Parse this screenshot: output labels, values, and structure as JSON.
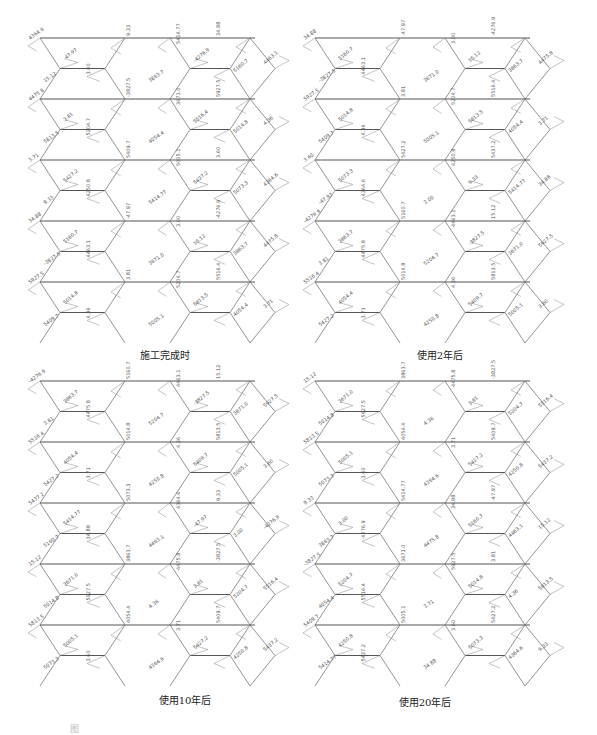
{
  "figure": {
    "type": "structural internal-force diagram (diagrid frame)",
    "panels": [
      {
        "id": "p1",
        "caption": "施工完成时",
        "x": 30,
        "y": 32,
        "w": 255,
        "h": 310,
        "cap_x": 165,
        "cap_y": 347
      },
      {
        "id": "p2",
        "caption": "使用2年后",
        "x": 305,
        "y": 32,
        "w": 255,
        "h": 310,
        "cap_x": 440,
        "cap_y": 347
      },
      {
        "id": "p3",
        "caption": "使用10年后",
        "x": 30,
        "y": 375,
        "w": 255,
        "h": 310,
        "cap_x": 185,
        "cap_y": 692
      },
      {
        "id": "p4",
        "caption": "使用20年后",
        "x": 305,
        "y": 375,
        "w": 255,
        "h": 310,
        "cap_x": 425,
        "cap_y": 694
      }
    ],
    "figure_caption": "图"
  },
  "sample_labels": [
    "4364.6",
    "9.33",
    "5414.77",
    "34.88",
    "-47.97",
    "3.00",
    "-4276.9",
    "5160.7",
    "4463.1",
    "15.12",
    "3863.7",
    "4475.8",
    "-3827.5",
    "3671.0",
    "5927.5",
    "3.81",
    "5204.7",
    "5516.4",
    "5014.8",
    "4.36",
    "5813.5",
    "4054.4",
    "3.71",
    "5409.7",
    "5005.1",
    "3.60",
    "5427.2",
    "4250.8",
    "5437.2",
    "5073.3"
  ],
  "colors": {
    "line": "#666666",
    "beam": "#555555",
    "text": "#222222"
  }
}
